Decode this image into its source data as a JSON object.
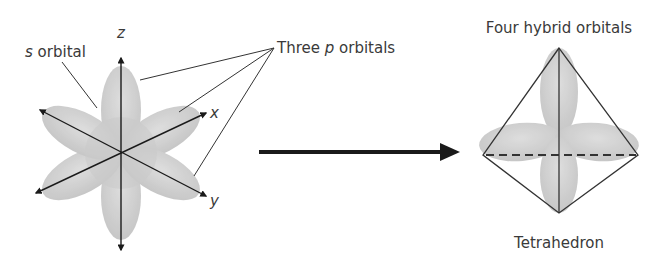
{
  "left_figure": {
    "s_label_italic": "s",
    "s_label_rest": " orbital",
    "p_label_pre": "Three ",
    "p_label_italic": "p",
    "p_label_post": " orbitals",
    "axis_z": "z",
    "axis_x": "x",
    "axis_y": "y"
  },
  "right_figure": {
    "title": "Four hybrid orbitals",
    "caption": "Tetrahedron"
  },
  "colors": {
    "orbital_fill": "#c8c8c8",
    "orbital_dark": "#b4b4b4",
    "line": "#333333",
    "arrow": "#1a1a1a"
  }
}
